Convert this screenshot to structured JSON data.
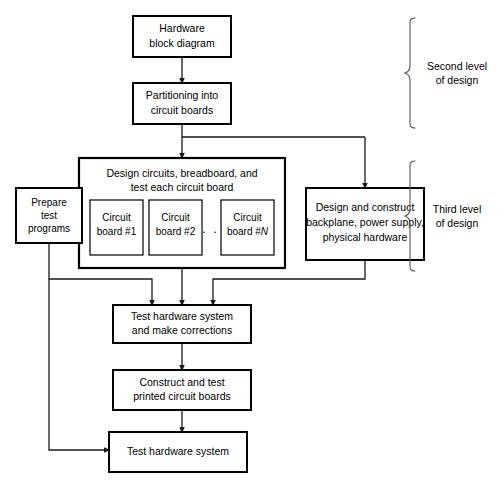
{
  "diagram": {
    "background_color": "#ffffff",
    "line_color": "#1a1a1a",
    "box_fill": "#ffffff",
    "box_stroke": "#000000",
    "brace_color": "#555555"
  },
  "nodes": {
    "hardware_block_diagram": {
      "line1": "Hardware",
      "line2": "block diagram"
    },
    "partitioning": {
      "line1": "Partitioning into",
      "line2": "circuit boards"
    },
    "design_circuits_group": {
      "line1": "Design circuits, breadboard, and",
      "line2": "test each circuit board"
    },
    "circuit_board_1": {
      "line1": "Circuit",
      "line2": "board #1"
    },
    "circuit_board_2": {
      "line1": "Circuit",
      "line2": "board #2"
    },
    "ellipsis": {
      "text": ". . ."
    },
    "circuit_board_n": {
      "line1": "Circuit",
      "line2_prefix": "board #",
      "line2_italic": "N"
    },
    "design_construct": {
      "line1": "Design and construct",
      "line2": "backplane, power supply,",
      "line3": "physical hardware"
    },
    "prepare_test_programs": {
      "line1": "Prepare",
      "line2": "test",
      "line3": "programs"
    },
    "test_hardware_corrections": {
      "line1": "Test hardware system",
      "line2": "and make corrections"
    },
    "construct_printed_boards": {
      "line1": "Construct and test",
      "line2": "printed circuit boards"
    },
    "test_hardware_system": {
      "line1": "Test hardware system"
    }
  },
  "braces": {
    "second_level": {
      "line1": "Second level",
      "line2": "of design"
    },
    "third_level": {
      "line1": "Third level",
      "line2": "of design"
    }
  }
}
